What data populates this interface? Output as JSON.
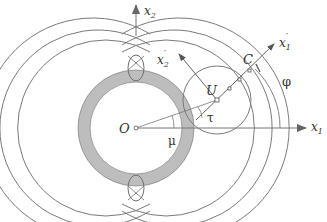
{
  "figure": {
    "labels": {
      "x1": "x",
      "x1_sub": "1",
      "x2": "x",
      "x2_sub": "2",
      "x1_prime": "x",
      "x1_prime_sub": "1",
      "x1_prime_mark": "′",
      "x2_prime": "x",
      "x2_prime_sub": "2",
      "x2_prime_mark": "′",
      "origin": "O",
      "point_U": "U",
      "point_C": "C",
      "angle_phi": "φ",
      "angle_mu": "μ",
      "angle_tau": "τ"
    },
    "colors": {
      "line": "#777777",
      "ring_fill": "#bdbdbd",
      "text": "#333333"
    }
  }
}
